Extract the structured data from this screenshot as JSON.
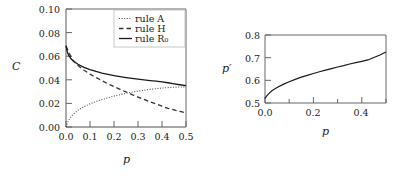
{
  "figure": {
    "background": "#ffffff",
    "ink_color": "#1a1a1a",
    "frame_color": "#555555"
  },
  "chart_data": [
    {
      "id": "left-panel",
      "type": "line",
      "title": "",
      "xlabel": "p",
      "ylabel": "C",
      "xlim": [
        0.0,
        0.5
      ],
      "ylim": [
        0.0,
        0.1
      ],
      "xticks": [
        0.0,
        0.1,
        0.2,
        0.3,
        0.4,
        0.5
      ],
      "xticklabels": [
        "0.0",
        "0.1",
        "0.2",
        "0.3",
        "0.4",
        "0.5"
      ],
      "yticks": [
        0.0,
        0.02,
        0.04,
        0.06,
        0.08,
        0.1
      ],
      "yticklabels": [
        "0.00",
        "0.02",
        "0.04",
        "0.06",
        "0.08",
        "0.10"
      ],
      "grid": false,
      "legend_position": "top-right",
      "series": [
        {
          "name": "rule A",
          "label": "rule A",
          "style": "dotted",
          "color": "#444444",
          "x": [
            0.0,
            0.01,
            0.02,
            0.03,
            0.05,
            0.075,
            0.1,
            0.125,
            0.15,
            0.175,
            0.2,
            0.225,
            0.25,
            0.275,
            0.3,
            0.325,
            0.35,
            0.375,
            0.4,
            0.425,
            0.45,
            0.475,
            0.5
          ],
          "y": [
            0.0,
            0.0055,
            0.0085,
            0.0108,
            0.0142,
            0.0172,
            0.0196,
            0.0216,
            0.0233,
            0.0248,
            0.0262,
            0.0274,
            0.0285,
            0.0295,
            0.0304,
            0.0312,
            0.0319,
            0.0325,
            0.033,
            0.0334,
            0.0337,
            0.0339,
            0.034
          ]
        },
        {
          "name": "rule H",
          "label": "rule H",
          "style": "dashed",
          "color": "#333333",
          "x": [
            0.0,
            0.025,
            0.05,
            0.075,
            0.1,
            0.125,
            0.15,
            0.175,
            0.2,
            0.225,
            0.25,
            0.275,
            0.3,
            0.325,
            0.35,
            0.375,
            0.4,
            0.425,
            0.45,
            0.475,
            0.5
          ],
          "y": [
            0.0685,
            0.0575,
            0.052,
            0.0481,
            0.0448,
            0.0419,
            0.0392,
            0.0366,
            0.0342,
            0.0319,
            0.0297,
            0.0275,
            0.0254,
            0.0234,
            0.0214,
            0.0195,
            0.0176,
            0.0158,
            0.0145,
            0.0132,
            0.012
          ]
        },
        {
          "name": "rule R0",
          "label": "rule R₀",
          "style": "solid",
          "color": "#1a1a1a",
          "x": [
            0.0,
            0.005,
            0.01,
            0.02,
            0.03,
            0.05,
            0.075,
            0.1,
            0.125,
            0.15,
            0.175,
            0.2,
            0.225,
            0.25,
            0.275,
            0.3,
            0.325,
            0.35,
            0.375,
            0.4,
            0.425,
            0.45,
            0.475,
            0.5
          ],
          "y": [
            0.069,
            0.064,
            0.0612,
            0.058,
            0.056,
            0.0532,
            0.0506,
            0.0487,
            0.0471,
            0.0457,
            0.0446,
            0.0436,
            0.0427,
            0.0419,
            0.0412,
            0.0405,
            0.0399,
            0.0393,
            0.0388,
            0.0383,
            0.0375,
            0.0366,
            0.0358,
            0.035
          ]
        }
      ]
    },
    {
      "id": "right-panel",
      "type": "line",
      "title": "",
      "xlabel": "p",
      "ylabel": "p′",
      "xlim": [
        0.0,
        0.5
      ],
      "ylim": [
        0.5,
        0.8
      ],
      "xticks": [
        0.0,
        0.2,
        0.4
      ],
      "xticklabels": [
        "0.0",
        "0.2",
        "0.4"
      ],
      "xminorticks": [
        0.1,
        0.3,
        0.5
      ],
      "yticks": [
        0.5,
        0.6,
        0.7,
        0.8
      ],
      "yticklabels": [
        "0.5",
        "0.6",
        "0.7",
        "0.8"
      ],
      "grid": false,
      "legend_position": "none",
      "series": [
        {
          "name": "p-prime",
          "label": "",
          "style": "solid",
          "color": "#1a1a1a",
          "x": [
            0.0,
            0.005,
            0.01,
            0.02,
            0.03,
            0.05,
            0.075,
            0.1,
            0.125,
            0.15,
            0.175,
            0.2,
            0.225,
            0.25,
            0.275,
            0.3,
            0.325,
            0.35,
            0.375,
            0.4,
            0.425,
            0.45,
            0.475,
            0.5
          ],
          "y": [
            0.52,
            0.528,
            0.535,
            0.546,
            0.555,
            0.568,
            0.582,
            0.594,
            0.604,
            0.614,
            0.622,
            0.63,
            0.638,
            0.645,
            0.652,
            0.659,
            0.665,
            0.672,
            0.678,
            0.684,
            0.69,
            0.701,
            0.712,
            0.725
          ]
        }
      ]
    }
  ]
}
